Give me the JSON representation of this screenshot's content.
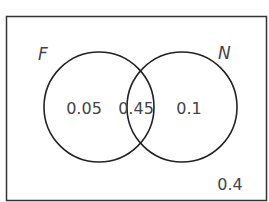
{
  "diagram": {
    "type": "venn",
    "sets": {
      "left": {
        "label": "F"
      },
      "right": {
        "label": "N"
      }
    },
    "regions": {
      "only_left": "0.05",
      "intersection": "0.45",
      "only_right": "0.1",
      "outside": "0.4"
    },
    "colors": {
      "stroke": "#222222",
      "text": "#444444",
      "background": "#ffffff"
    }
  }
}
